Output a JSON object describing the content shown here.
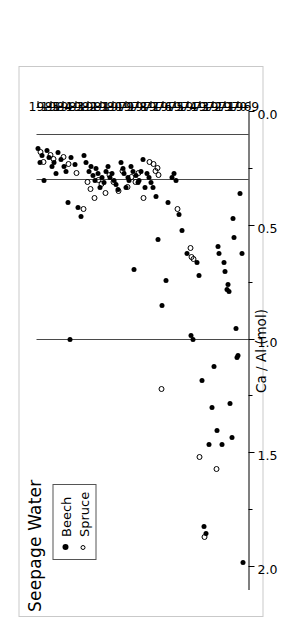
{
  "figure": {
    "title": "Seepage Water",
    "outer_border_color": "#c9c9c9"
  },
  "legend": {
    "entries": [
      {
        "label": "Beech",
        "symbol": "filled-circle-icon",
        "color": "#000000"
      },
      {
        "label": "Spruce",
        "symbol": "open-circle-icon",
        "color": "#000000"
      }
    ]
  },
  "chart_data": {
    "type": "scatter",
    "title": "Seepage Water",
    "xlabel": "",
    "ylabel": "Ca / Al (mol)",
    "xlim": [
      1968.6,
      1985.6
    ],
    "ylim": [
      0.0,
      2.1
    ],
    "grid": false,
    "legend_position": "top-left",
    "x_tick_labels": [
      "1969",
      "1970",
      "1971",
      "1972",
      "1973",
      "1974",
      "1975",
      "1976",
      "1977",
      "1978",
      "1979",
      "1980",
      "1981",
      "1982",
      "1983",
      "1984",
      "1985"
    ],
    "x_ticks": [
      1969,
      1970,
      1971,
      1972,
      1973,
      1974,
      1975,
      1976,
      1977,
      1978,
      1979,
      1980,
      1981,
      1982,
      1983,
      1984,
      1985
    ],
    "y_tick_labels": [
      "0.0",
      "0.5",
      "1.0",
      "1.5",
      "2.0"
    ],
    "y_ticks": [
      0.0,
      0.5,
      1.0,
      1.5,
      2.0
    ],
    "y_minor_ticks": [
      0.25,
      0.75,
      1.25,
      1.75
    ],
    "reference_lines": [
      {
        "value": 1.0,
        "label": ""
      },
      {
        "value": 0.3,
        "label": ""
      },
      {
        "value": 0.1,
        "label": ""
      }
    ],
    "series": [
      {
        "name": "Beech",
        "marker": "filled-circle",
        "color": "#000000",
        "points": [
          [
            1969.05,
            1.98
          ],
          [
            1969.15,
            0.62
          ],
          [
            1969.25,
            0.36
          ],
          [
            1969.45,
            1.07
          ],
          [
            1969.55,
            1.08
          ],
          [
            1969.62,
            0.95
          ],
          [
            1969.75,
            0.55
          ],
          [
            1969.85,
            0.47
          ],
          [
            1969.95,
            1.43
          ],
          [
            1970.05,
            1.28
          ],
          [
            1970.15,
            0.79
          ],
          [
            1970.22,
            0.76
          ],
          [
            1970.35,
            0.78
          ],
          [
            1970.45,
            0.7
          ],
          [
            1970.55,
            0.66
          ],
          [
            1970.75,
            1.46
          ],
          [
            1970.95,
            0.62
          ],
          [
            1971.05,
            0.59
          ],
          [
            1971.15,
            1.4
          ],
          [
            1971.35,
            1.12
          ],
          [
            1971.55,
            1.3
          ],
          [
            1971.75,
            1.46
          ],
          [
            1972.05,
            1.85
          ],
          [
            1972.15,
            1.82
          ],
          [
            1972.35,
            1.18
          ],
          [
            1972.55,
            0.72
          ],
          [
            1972.75,
            0.66
          ],
          [
            1973.05,
            1.0
          ],
          [
            1973.25,
            0.98
          ],
          [
            1973.55,
            0.62
          ],
          [
            1973.95,
            0.52
          ],
          [
            1974.15,
            0.45
          ],
          [
            1974.45,
            0.3
          ],
          [
            1974.55,
            0.27
          ],
          [
            1974.75,
            0.29
          ],
          [
            1975.05,
            0.4
          ],
          [
            1975.25,
            0.74
          ],
          [
            1975.55,
            0.85
          ],
          [
            1975.85,
            0.56
          ],
          [
            1976.05,
            0.37
          ],
          [
            1976.25,
            0.33
          ],
          [
            1976.45,
            0.31
          ],
          [
            1976.6,
            0.29
          ],
          [
            1976.75,
            0.27
          ],
          [
            1976.9,
            0.33
          ],
          [
            1977.05,
            0.21
          ],
          [
            1977.2,
            0.26
          ],
          [
            1977.35,
            0.3
          ],
          [
            1977.5,
            0.31
          ],
          [
            1977.62,
            0.28
          ],
          [
            1977.75,
            0.69
          ],
          [
            1977.88,
            0.26
          ],
          [
            1978.02,
            0.24
          ],
          [
            1978.15,
            0.3
          ],
          [
            1978.28,
            0.29
          ],
          [
            1978.42,
            0.33
          ],
          [
            1978.55,
            0.27
          ],
          [
            1978.7,
            0.25
          ],
          [
            1978.85,
            0.22
          ],
          [
            1979.05,
            0.34
          ],
          [
            1979.2,
            0.32
          ],
          [
            1979.35,
            0.3
          ],
          [
            1979.55,
            0.27
          ],
          [
            1979.72,
            0.29
          ],
          [
            1979.88,
            0.24
          ],
          [
            1980.05,
            0.26
          ],
          [
            1980.2,
            0.31
          ],
          [
            1980.35,
            0.29
          ],
          [
            1980.5,
            0.33
          ],
          [
            1980.65,
            0.27
          ],
          [
            1980.8,
            0.25
          ],
          [
            1980.95,
            0.3
          ],
          [
            1981.1,
            0.28
          ],
          [
            1981.25,
            0.24
          ],
          [
            1981.4,
            0.26
          ],
          [
            1981.6,
            0.22
          ],
          [
            1981.8,
            0.19
          ],
          [
            1982.05,
            0.46
          ],
          [
            1982.25,
            0.42
          ],
          [
            1982.55,
            0.23
          ],
          [
            1982.8,
            0.2
          ],
          [
            1983.05,
            0.4
          ],
          [
            1983.2,
            0.26
          ],
          [
            1983.4,
            0.24
          ],
          [
            1983.62,
            0.21
          ],
          [
            1983.85,
            0.18
          ],
          [
            1984.05,
            0.27
          ],
          [
            1984.22,
            0.22
          ],
          [
            1984.4,
            0.24
          ],
          [
            1984.6,
            0.2
          ],
          [
            1984.8,
            0.17
          ],
          [
            1985.02,
            0.3
          ],
          [
            1985.18,
            0.19
          ],
          [
            1985.35,
            0.22
          ],
          [
            1985.5,
            0.16
          ],
          [
            1982.95,
            1.0
          ]
        ]
      },
      {
        "name": "Spruce",
        "marker": "open-circle",
        "color": "#000000",
        "points": [
          [
            1971.25,
            1.57
          ],
          [
            1972.2,
            1.87
          ],
          [
            1972.55,
            1.52
          ],
          [
            1973.05,
            0.65
          ],
          [
            1973.18,
            0.64
          ],
          [
            1973.3,
            0.6
          ],
          [
            1974.35,
            0.43
          ],
          [
            1975.6,
            1.22
          ],
          [
            1975.85,
            0.28
          ],
          [
            1975.95,
            0.25
          ],
          [
            1976.1,
            0.26
          ],
          [
            1976.3,
            0.23
          ],
          [
            1976.55,
            0.22
          ],
          [
            1977.05,
            0.38
          ],
          [
            1977.45,
            0.27
          ],
          [
            1977.7,
            0.31
          ],
          [
            1978.05,
            0.29
          ],
          [
            1978.35,
            0.33
          ],
          [
            1978.75,
            0.26
          ],
          [
            1979.1,
            0.35
          ],
          [
            1979.5,
            0.31
          ],
          [
            1979.8,
            0.28
          ],
          [
            1980.15,
            0.36
          ],
          [
            1980.45,
            0.32
          ],
          [
            1980.7,
            0.3
          ],
          [
            1981.0,
            0.38
          ],
          [
            1981.3,
            0.34
          ],
          [
            1981.55,
            0.31
          ],
          [
            1981.9,
            0.43
          ],
          [
            1982.4,
            0.27
          ],
          [
            1983.1,
            0.23
          ],
          [
            1983.45,
            0.2
          ],
          [
            1984.3,
            0.21
          ],
          [
            1984.55,
            0.19
          ],
          [
            1985.1,
            0.22
          ],
          [
            1985.3,
            0.18
          ]
        ]
      }
    ]
  }
}
